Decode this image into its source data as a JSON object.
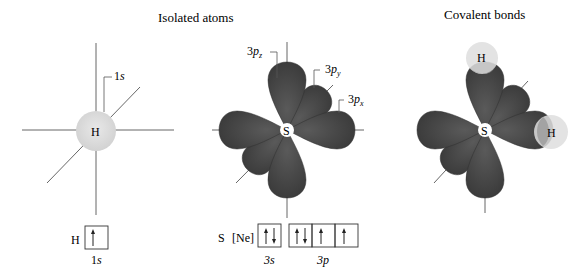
{
  "titles": {
    "isolated": "Isolated atoms",
    "covalent": "Covalent bonds"
  },
  "hydrogen": {
    "atom_label": "H",
    "orbital_label_main": "1",
    "orbital_label_ital": "s",
    "config_label": "H",
    "config_box_label_main": "1",
    "config_box_label_ital": "s",
    "config_boxes": [
      [
        "up"
      ]
    ]
  },
  "sulfur": {
    "atom_label": "S",
    "orbital_labels": [
      {
        "main": "3",
        "p": "p",
        "sub": "z"
      },
      {
        "main": "3",
        "p": "p",
        "sub": "y"
      },
      {
        "main": "3",
        "p": "p",
        "sub": "x"
      }
    ],
    "config_label": "S",
    "config_core": "[Ne]",
    "subshell_3s_label": "3s",
    "subshell_3p_label": "3p",
    "config_3s": [
      [
        "up",
        "down"
      ]
    ],
    "config_3p": [
      [
        "up",
        "down"
      ],
      [
        "up"
      ],
      [
        "up"
      ]
    ]
  },
  "covalent": {
    "center_label": "S",
    "bonded_labels": [
      "H",
      "H"
    ]
  },
  "colors": {
    "lobe": "#4a4a4a",
    "lobe_dark": "#333333",
    "h_sphere": "#dcdcdc",
    "overlap": "#9a9a9a",
    "axis": "#555555",
    "text": "#1a1a1a"
  }
}
